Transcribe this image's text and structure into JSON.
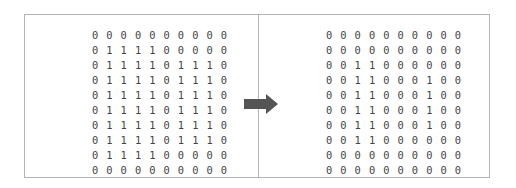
{
  "figure": {
    "left_grid": {
      "rows": [
        "0 0 0 0 0 0 0 0 0 0",
        "0 1 1 1 1 0 0 0 0 0",
        "0 1 1 1 1 0 1 1 1 0",
        "0 1 1 1 1 0 1 1 1 0",
        "0 1 1 1 1 0 1 1 1 0",
        "0 1 1 1 1 0 1 1 1 0",
        "0 1 1 1 1 0 1 1 1 0",
        "0 1 1 1 1 0 1 1 1 0",
        "0 1 1 1 1 0 0 0 0 0",
        "0 0 0 0 0 0 0 0 0 0"
      ]
    },
    "right_grid": {
      "rows": [
        "0 0 0 0 0 0 0 0 0 0",
        "0 0 0 0 0 0 0 0 0 0",
        "0 0 1 1 0 0 0 0 0 0",
        "0 0 1 1 0 0 0 1 0 0",
        "0 0 1 1 0 0 0 1 0 0",
        "0 0 1 1 0 0 0 1 0 0",
        "0 0 1 1 0 0 0 1 0 0",
        "0 0 1 1 0 0 0 0 0 0",
        "0 0 0 0 0 0 0 0 0 0",
        "0 0 0 0 0 0 0 0 0 0"
      ]
    },
    "arrow": {
      "icon": "right-arrow-icon",
      "color": "#555555"
    },
    "colors": {
      "border": "#b4b4b4",
      "text": "#444444"
    }
  }
}
